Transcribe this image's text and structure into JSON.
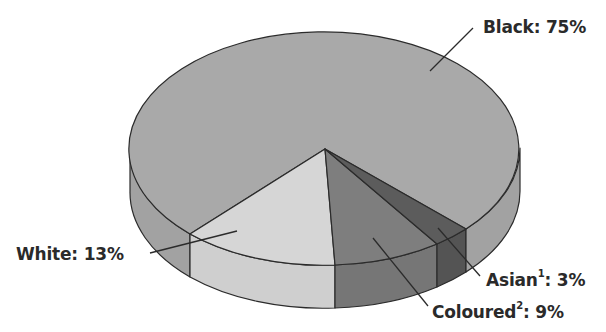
{
  "chart_data": {
    "type": "pie",
    "variant": "3d",
    "title": "",
    "slices": [
      {
        "label": "Black",
        "value": 75,
        "display": "Black: 75%",
        "color": "#a9a9a9",
        "wall": "#a2a2a2"
      },
      {
        "label": "White",
        "value": 13,
        "display": "White: 13%",
        "color": "#d6d6d6",
        "wall": "#cfcfcf"
      },
      {
        "label": "Coloured",
        "value": 9,
        "display": "Coloured: 9%",
        "footnote": "2",
        "color": "#7e7e7e",
        "wall": "#767676"
      },
      {
        "label": "Asian",
        "value": 3,
        "display": "Asian: 3%",
        "footnote": "1",
        "color": "#5c5c5c",
        "wall": "#545454"
      }
    ],
    "legend": "none",
    "units": "%"
  },
  "labels": {
    "black": {
      "name": "Black",
      "sup": "",
      "value": ": 75%"
    },
    "white": {
      "name": "White",
      "sup": "",
      "value": ": 13%"
    },
    "coloured": {
      "name": "Coloured",
      "sup": "2",
      "value": ": 9%"
    },
    "asian": {
      "name": "Asian",
      "sup": "1",
      "value": ": 3%"
    }
  },
  "geometry": {
    "cx": 325,
    "cy": 148,
    "rx": 195,
    "ry": 117,
    "depth": 43,
    "apex": [
      325,
      149
    ],
    "white_start": [
      190,
      234
    ],
    "white_end": [
      335,
      265
    ],
    "coloured_end": [
      437,
      244
    ],
    "asian_end": [
      466,
      229
    ],
    "leaders": {
      "black": [
        [
          430,
          71
        ],
        [
          473,
          28
        ]
      ],
      "white": [
        [
          237,
          231
        ],
        [
          150,
          253
        ]
      ],
      "coloured": [
        [
          373,
          238
        ],
        [
          428,
          306
        ]
      ],
      "asian": [
        [
          438,
          228
        ],
        [
          480,
          276
        ]
      ]
    }
  }
}
